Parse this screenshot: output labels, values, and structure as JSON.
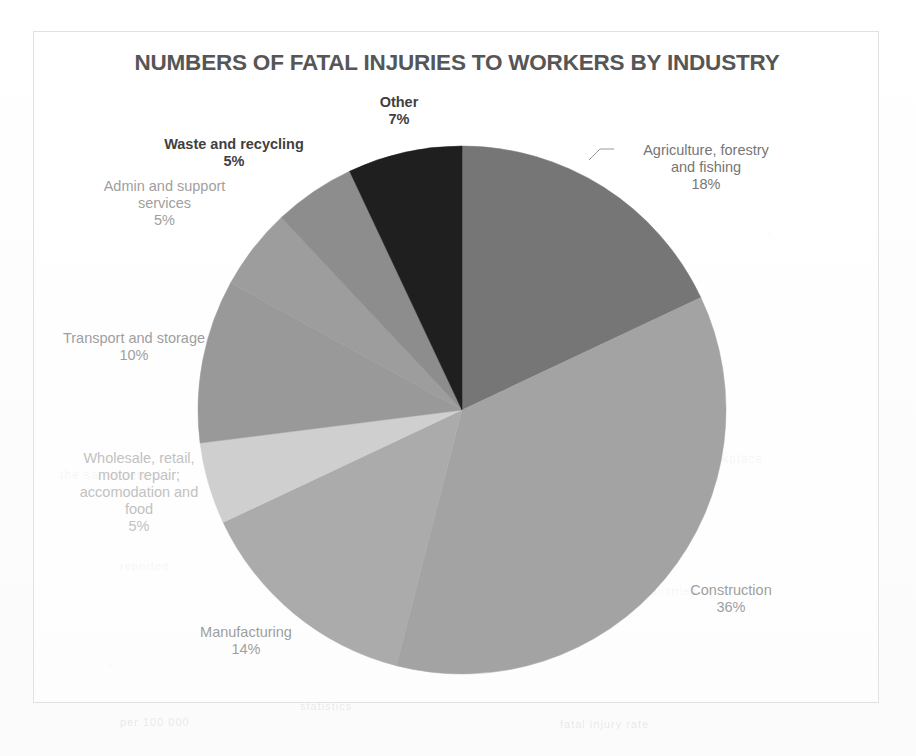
{
  "chart": {
    "title": "NUMBERS OF FATAL INJURIES TO WORKERS BY INDUSTRY"
  },
  "bleed_text": [
    {
      "text": "the same period",
      "x": 60,
      "y": 468,
      "size": 12
    },
    {
      "text": "workplace",
      "x": 700,
      "y": 452,
      "size": 12
    },
    {
      "text": "reported",
      "x": 120,
      "y": 560,
      "size": 11
    },
    {
      "text": "industries",
      "x": 640,
      "y": 585,
      "size": 11
    },
    {
      "text": "statistics",
      "x": 300,
      "y": 700,
      "size": 11
    },
    {
      "text": "fatal injury rate",
      "x": 560,
      "y": 718,
      "size": 11
    },
    {
      "text": "per 100 000",
      "x": 120,
      "y": 716,
      "size": 11
    }
  ],
  "chart_data": {
    "type": "pie",
    "title": "NUMBERS OF FATAL INJURIES TO WORKERS BY INDUSTRY",
    "xlabel": "",
    "ylabel": "",
    "legend": "none",
    "grid": false,
    "units": "percent",
    "start_angle_deg": 0,
    "direction": "clockwise",
    "categories": [
      "Agriculture, forestry and fishing",
      "Construction",
      "Manufacturing",
      "Wholesale, retail, motor repair; accomodation and food",
      "Transport and storage",
      "Admin and support services",
      "Waste and recycling",
      "Other"
    ],
    "values": [
      18,
      36,
      14,
      5,
      10,
      5,
      5,
      7
    ],
    "value_labels": [
      "18%",
      "36%",
      "14%",
      "5%",
      "10%",
      "5%",
      "5%",
      "7%"
    ],
    "colors": [
      "#767676",
      "#a3a3a3",
      "#ababab",
      "#cfcfcf",
      "#999999",
      "#9d9d9d",
      "#8d8d8d",
      "#1f1f1f"
    ],
    "slices": [
      {
        "name": "Agriculture, forestry and fishing",
        "label": "Agriculture, forestry\nand fishing",
        "value": 18,
        "pct_label": "18%",
        "color": "#767676",
        "start_deg": 0,
        "end_deg": 64.8,
        "tone": "tone-mid"
      },
      {
        "name": "Construction",
        "label": "Construction",
        "value": 36,
        "pct_label": "36%",
        "color": "#a3a3a3",
        "start_deg": 64.8,
        "end_deg": 194.4,
        "tone": "tone-light"
      },
      {
        "name": "Manufacturing",
        "label": "Manufacturing",
        "value": 14,
        "pct_label": "14%",
        "color": "#ababab",
        "start_deg": 194.4,
        "end_deg": 244.8,
        "tone": "tone-light"
      },
      {
        "name": "Wholesale, retail, motor repair; accomodation and food",
        "label": "Wholesale, retail,\nmotor repair;\naccomodation and\nfood",
        "value": 5,
        "pct_label": "5%",
        "color": "#cfcfcf",
        "start_deg": 244.8,
        "end_deg": 262.8,
        "tone": "tone-faint"
      },
      {
        "name": "Transport and storage",
        "label": "Transport and storage",
        "value": 10,
        "pct_label": "10%",
        "color": "#999999",
        "start_deg": 262.8,
        "end_deg": 298.8,
        "tone": "tone-light"
      },
      {
        "name": "Admin and support services",
        "label": "Admin and support\nservices",
        "value": 5,
        "pct_label": "5%",
        "color": "#9d9d9d",
        "start_deg": 298.8,
        "end_deg": 316.8,
        "tone": "tone-light"
      },
      {
        "name": "Waste and recycling",
        "label": "Waste and recycling",
        "value": 5,
        "pct_label": "5%",
        "color": "#8d8d8d",
        "start_deg": 316.8,
        "end_deg": 334.8,
        "tone": "tone-dark"
      },
      {
        "name": "Other",
        "label": "Other",
        "value": 7,
        "pct_label": "7%",
        "color": "#1f1f1f",
        "start_deg": 334.8,
        "end_deg": 360,
        "tone": "tone-dark"
      }
    ],
    "geometry": {
      "cx": 428,
      "cy": 378,
      "r": 264
    },
    "label_positions": [
      {
        "name": "Agriculture, forestry and fishing",
        "x": 572,
        "y": 110,
        "w": 200
      },
      {
        "name": "Construction",
        "x": 612,
        "y": 550,
        "w": 170
      },
      {
        "name": "Manufacturing",
        "x": 122,
        "y": 592,
        "w": 180
      },
      {
        "name": "Wholesale, retail, motor repair; accomodation and food",
        "x": 10,
        "y": 418,
        "w": 190
      },
      {
        "name": "Transport and storage",
        "x": -5,
        "y": 298,
        "w": 210
      },
      {
        "name": "Admin and support services",
        "x": 38,
        "y": 146,
        "w": 185
      },
      {
        "name": "Waste and recycling",
        "x": 105,
        "y": 104,
        "w": 190
      },
      {
        "name": "Other",
        "x": 300,
        "y": 62,
        "w": 130
      }
    ]
  }
}
